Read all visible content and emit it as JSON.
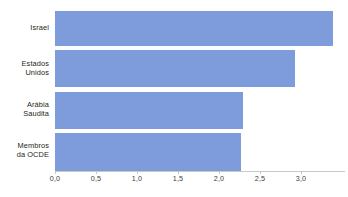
{
  "chart_data": {
    "type": "bar",
    "orientation": "horizontal",
    "title": "",
    "subtitle": "",
    "xlabel": "",
    "ylabel": "",
    "categories": [
      "Israel",
      "Estados Unidos",
      "Arábia Saudita",
      "Membros da OCDE"
    ],
    "values": [
      3.39,
      2.93,
      2.29,
      2.27
    ],
    "series": [
      {
        "name": "",
        "values": [
          3.39,
          2.93,
          2.29,
          2.27
        ]
      }
    ],
    "xlim": [
      0.0,
      3.55
    ],
    "ylim": null,
    "xticks": [
      0.0,
      0.5,
      1.0,
      1.5,
      2.0,
      2.5,
      3.0
    ],
    "xticklabels": [
      "0,0",
      "0,5",
      "1,0",
      "1,5",
      "2,0",
      "2,5",
      "3,0"
    ],
    "decimal_separator": ",",
    "grid": false,
    "legend": false,
    "legend_position": "none",
    "annotations": [],
    "bar_color": "#7e9bdc",
    "axis_color": "#c9c9c9",
    "text_color": "#231f20",
    "background": "#ffffff"
  },
  "axis": {
    "tick_labels": [
      "0,0",
      "0,5",
      "1,0",
      "1,5",
      "2,0",
      "2,5",
      "3,0"
    ]
  },
  "categories": [
    {
      "label": "Israel",
      "value": 3.39
    },
    {
      "label": "Estados\nUnidos",
      "value": 2.93
    },
    {
      "label": "Arábia\nSaudita",
      "value": 2.29
    },
    {
      "label": "Membros\nda OCDE",
      "value": 2.27
    }
  ]
}
